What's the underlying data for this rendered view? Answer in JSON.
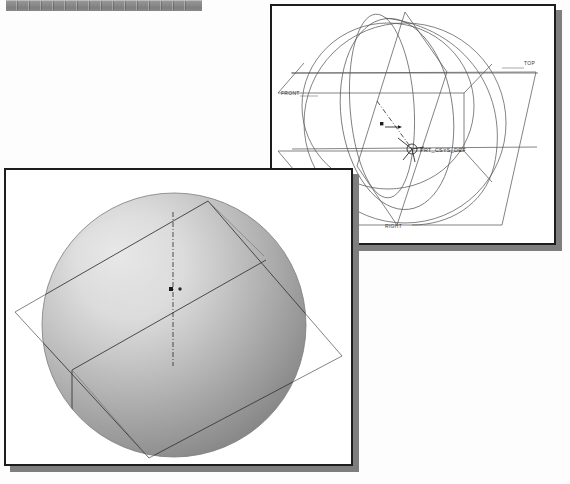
{
  "page": {
    "background_color": "#fdfdfd",
    "width": 570,
    "height": 484
  },
  "toolbar_strip": {
    "name": "cropped-toolbar-strip",
    "color": "#8d8d8d"
  },
  "windows": [
    {
      "id": "wireframe",
      "title": "",
      "view_mode": "Wireframe",
      "background_color": "#ffffff",
      "border_color": "#1d1d1d",
      "shadow_color": "#7e7e7e",
      "datum_planes": [
        {
          "label": "TOP"
        },
        {
          "label": "FRONT"
        },
        {
          "label": "RIGHT"
        }
      ],
      "coordinate_system": {
        "label": "PRT_CSYS_DEF"
      },
      "geometry_line_color": "#5a5a5a"
    },
    {
      "id": "shaded",
      "title": "",
      "view_mode": "Shaded",
      "background_color": "#ffffff",
      "border_color": "#1d1d1d",
      "shadow_color": "#7e7e7e",
      "model": {
        "shape": "sphere",
        "highlight_color": "#dcdcdc",
        "midtone_color": "#b4b4b4",
        "shadow_color": "#8b8b8b"
      },
      "datum_planes": [
        {
          "label": ""
        }
      ],
      "geometry_line_color": "#5a5a5a"
    }
  ]
}
